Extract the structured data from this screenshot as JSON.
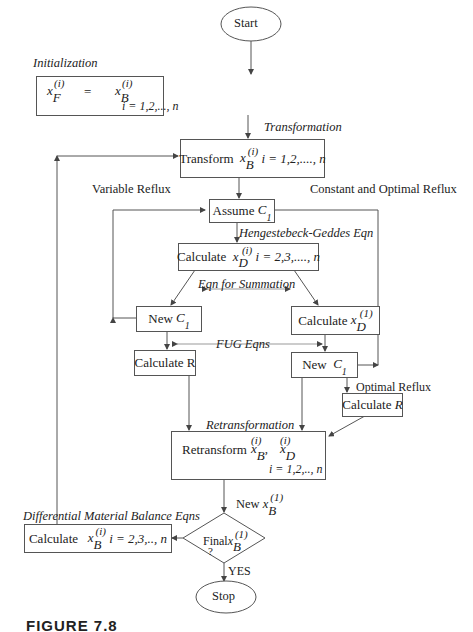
{
  "nodes": {
    "start": "Start",
    "init_lhs": "x",
    "init_lhs_sub": "F",
    "init_rhs": "x",
    "init_rhs_sub": "B",
    "sup_i": "(i)",
    "sup_1": "(1)",
    "equals": "=",
    "init_range": "i = 1,2,..., n",
    "transform_label": "Transform",
    "transform_range": "i = 1,2,...., n",
    "assume_label": "Assume",
    "c1": "C",
    "c1_sub": "1",
    "calc_xd_label": "Calculate",
    "calc_xd_range": "i = 2,3,...., n",
    "new_c1_left": "New",
    "calc_xd1_label": "Calculate",
    "calc_r_left": "Calculate R",
    "new_c1_right": "New",
    "calc_r_right_label": "Calculate",
    "calc_r_right_var": "R",
    "retransform_label": "Retransform",
    "retransform_range": "i = 1,2,.., n",
    "calc_xb_label": "Calculate",
    "calc_xb_range": "i = 2,3,.., n",
    "final_label": "Final",
    "final_q": "?",
    "stop": "Stop"
  },
  "edges": {
    "initialization": "Initialization",
    "transformation": "Transformation",
    "variable_reflux": "Variable Reflux",
    "constant_optimal_reflux": "Constant and Optimal Reflux",
    "hengestebeck": "Hengestebeck-Geddes Eqn",
    "summation": "Eqn for Summation",
    "fug": "FUG Eqns",
    "optimal_reflux": "Optimal Reflux",
    "retransformation": "Retransformation",
    "new_xb": "New",
    "diff_balance": "Differential Material Balance Eqns",
    "yes": "YES"
  },
  "caption": "FIGURE 7.8"
}
